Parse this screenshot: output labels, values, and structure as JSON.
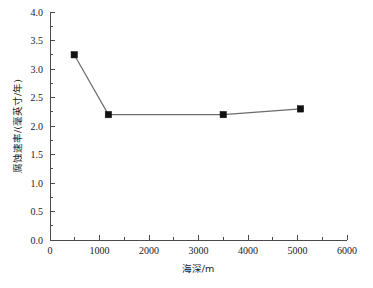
{
  "chart_data": {
    "type": "line",
    "title": "",
    "xlabel": "海深/m",
    "ylabel": "腐蚀速率/(毫英寸/年)",
    "xlim": [
      0,
      6000
    ],
    "ylim": [
      0.0,
      4.0
    ],
    "xticks": [
      0,
      1000,
      2000,
      3000,
      4000,
      5000,
      6000
    ],
    "xtick_labels": [
      "0",
      "1000",
      "2000",
      "3000",
      "4000",
      "5000",
      "6000"
    ],
    "yticks": [
      0.0,
      0.5,
      1.0,
      1.5,
      2.0,
      2.5,
      3.0,
      3.5,
      4.0
    ],
    "ytick_labels": [
      "0.0",
      "0.5",
      "1.0",
      "1.5",
      "2.0",
      "2.5",
      "3.0",
      "3.5",
      "4.0"
    ],
    "x_minor_ticks": [
      500,
      1500,
      2500,
      3500,
      4500,
      5500
    ],
    "y_minor_ticks": [
      0.25,
      0.75,
      1.25,
      1.75,
      2.25,
      2.75,
      3.25,
      3.75
    ],
    "grid": false,
    "legend": null,
    "marker": "square",
    "line_color": "#6b6b6b",
    "marker_color": "#111111",
    "series": [
      {
        "name": "腐蚀速率",
        "x": [
          490,
          1180,
          3500,
          5060
        ],
        "values": [
          3.25,
          2.2,
          2.2,
          2.3
        ]
      }
    ]
  }
}
